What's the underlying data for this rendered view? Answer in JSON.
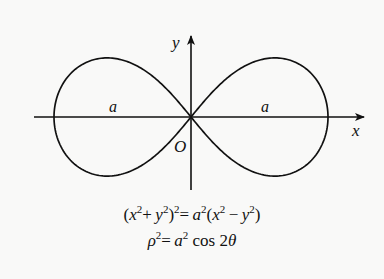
{
  "diagram": {
    "axes": {
      "x_label": "x",
      "y_label": "y",
      "origin_label": "O"
    },
    "segment_labels": [
      "a",
      "a"
    ],
    "equations": {
      "cartesian": {
        "lhs_base": "(x",
        "parts": [
          "(",
          "x",
          "2",
          "+",
          "y",
          "2",
          ")",
          "2",
          "=",
          "a",
          "2",
          "(",
          "x",
          "2",
          "−",
          "y",
          "2",
          ")"
        ],
        "text": "(x²+y²)² = a²(x²−y²)"
      },
      "polar": {
        "text": "ρ² = a² cos 2θ"
      }
    },
    "geometry": {
      "origin_px": [
        191,
        117
      ],
      "a_px": 137,
      "y_stretch": 1.22,
      "x_axis_px": [
        34,
        364
      ],
      "y_axis_px": [
        190,
        36
      ],
      "stroke_color": "#111111",
      "background": "#f9f9f8"
    }
  }
}
